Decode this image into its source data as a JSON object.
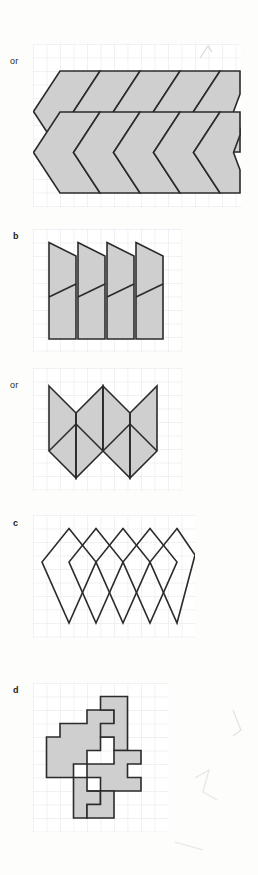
{
  "page": {
    "background": "#fdfdfc",
    "width": 258,
    "height": 875
  },
  "style": {
    "grid_line_color": "#e4e4e8",
    "grid_cell_px": 14,
    "shape_fill": "#cfcfcf",
    "shape_fill_empty": "#ffffff",
    "shape_stroke": "#2b2b2b",
    "shape_stroke_width": 1.6,
    "label_color": "#1b1b1b"
  },
  "panels": [
    {
      "id": "panel-a-or",
      "label": "or",
      "label_bold": false,
      "label_x": 10,
      "label_y": 57,
      "grid": {
        "x": 33,
        "y": 44,
        "cols": 15,
        "rows": 12,
        "cell": 13.5
      },
      "figure_type": "chevron-tessellation",
      "shape_count": 10,
      "fill": "#cfcfcf",
      "notes": "Two rows of five interlocking left-pointing chevron (arrow) tiles"
    },
    {
      "id": "panel-b",
      "label": "b",
      "label_bold": true,
      "label_x": 13,
      "label_y": 232,
      "grid": {
        "x": 33,
        "y": 229,
        "cols": 11,
        "rows": 9,
        "cell": 13.5
      },
      "figure_type": "slanted-quadrilateral-strip",
      "shape_count": 4,
      "fill": "#cfcfcf",
      "notes": "Four overlapping slanted quadrilateral tiles, each split by a diagonal"
    },
    {
      "id": "panel-b-or",
      "label": "or",
      "label_bold": false,
      "label_x": 10,
      "label_y": 381,
      "grid": {
        "x": 33,
        "y": 368,
        "cols": 11,
        "rows": 9,
        "cell": 13.5
      },
      "figure_type": "zigzag-chevron-tessellation",
      "shape_count": 6,
      "fill": "#cfcfcf",
      "notes": "Zigzag arrangement of six chevron tiles in two rows"
    },
    {
      "id": "panel-c",
      "label": "c",
      "label_bold": true,
      "label_x": 13,
      "label_y": 519,
      "grid": {
        "x": 33,
        "y": 515,
        "cols": 12,
        "rows": 9,
        "cell": 13.5
      },
      "figure_type": "overlapping-rhombi",
      "shape_count": 5,
      "fill": "#ffffff",
      "notes": "Five tall unfilled rhombi (lozenges) overlapping horizontally"
    },
    {
      "id": "panel-d",
      "label": "d",
      "label_bold": true,
      "label_x": 13,
      "label_y": 686,
      "grid": {
        "x": 33,
        "y": 683,
        "cols": 10,
        "rows": 10,
        "cell": 13.5
      },
      "figure_type": "interlocking-polyomino-tessellation",
      "shape_count": 4,
      "fill": "#cfcfcf",
      "notes": "Four interlocking jigsaw-like polyomino tiles with stepped edges"
    }
  ]
}
